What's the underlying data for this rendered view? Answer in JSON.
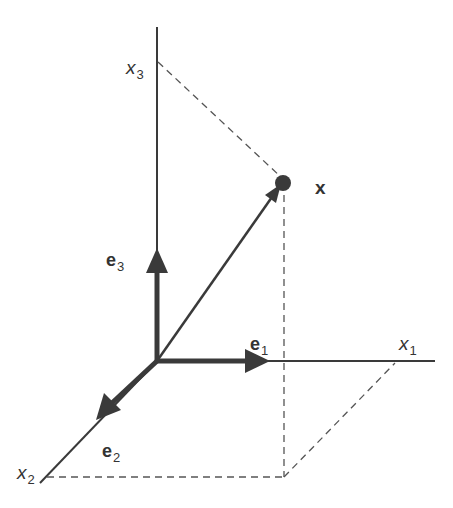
{
  "diagram": {
    "title": "",
    "colors": {
      "axis": "#3a3a3a",
      "vector": "#3a3a3a",
      "dashed": "#555555",
      "background": "#ffffff",
      "text": "#333333"
    },
    "axes": [
      {
        "id": "x1",
        "label": "x",
        "subscript": "1"
      },
      {
        "id": "x2",
        "label": "x",
        "subscript": "2"
      },
      {
        "id": "x3",
        "label": "x",
        "subscript": "3"
      }
    ],
    "basis_vectors": [
      {
        "id": "e1",
        "label": "e",
        "subscript": "1"
      },
      {
        "id": "e2",
        "label": "e",
        "subscript": "2"
      },
      {
        "id": "e3",
        "label": "e",
        "subscript": "3"
      }
    ],
    "point": {
      "label": "x"
    }
  }
}
